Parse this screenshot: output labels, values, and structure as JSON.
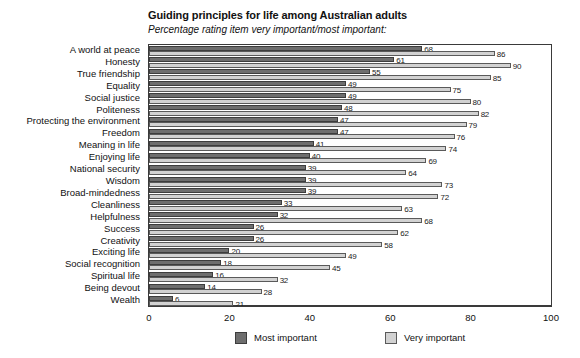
{
  "chart_data": {
    "type": "bar",
    "orientation": "horizontal",
    "grouped": true,
    "title": "Guiding principles for life among Australian adults",
    "subtitle": "Percentage rating item very important/most important:",
    "xlabel": "",
    "ylabel": "",
    "xlim": [
      0,
      100
    ],
    "xticks": [
      0,
      20,
      40,
      60,
      80,
      100
    ],
    "xtick_labels": [
      "0",
      "20",
      "40",
      "60",
      "80",
      "100"
    ],
    "grid": false,
    "legend_position": "bottom",
    "categories": [
      "A world at peace",
      "Honesty",
      "True friendship",
      "Equality",
      "Social justice",
      "Politeness",
      "Protecting the environment",
      "Freedom",
      "Meaning in life",
      "Enjoying life",
      "National security",
      "Wisdom",
      "Broad-mindedness",
      "Cleanliness",
      "Helpfulness",
      "Success",
      "Creativity",
      "Exciting life",
      "Social recognition",
      "Spiritual life",
      "Being devout",
      "Wealth"
    ],
    "series": [
      {
        "name": "Most important",
        "color": "#6e6e6e",
        "values": [
          68,
          61,
          55,
          49,
          49,
          48,
          47,
          47,
          41,
          40,
          39,
          39,
          39,
          33,
          32,
          26,
          26,
          20,
          18,
          16,
          14,
          6
        ]
      },
      {
        "name": "Very important",
        "color": "#d2d2d2",
        "values": [
          86,
          90,
          85,
          75,
          80,
          82,
          79,
          76,
          74,
          69,
          64,
          73,
          72,
          63,
          68,
          62,
          58,
          49,
          45,
          32,
          28,
          21
        ]
      }
    ]
  },
  "legend": {
    "items": [
      {
        "label": "Most important",
        "swatch": "most"
      },
      {
        "label": "Very important",
        "swatch": "very"
      }
    ]
  }
}
